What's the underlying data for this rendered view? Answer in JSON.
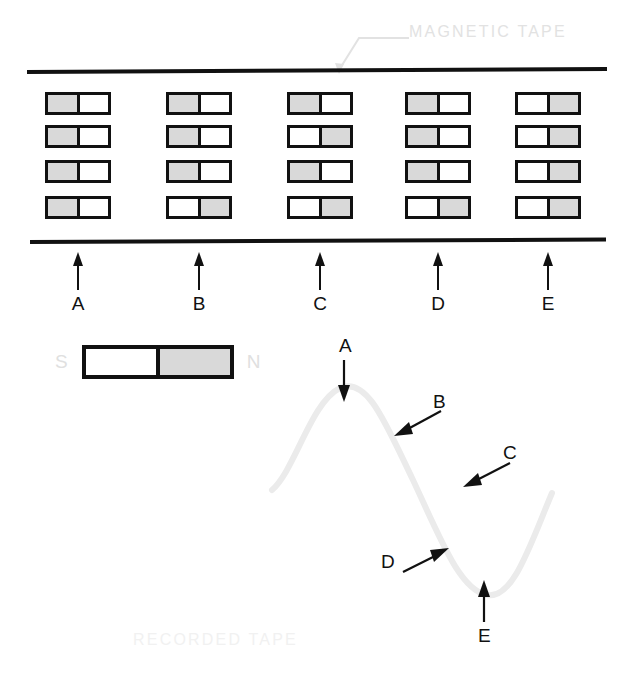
{
  "figure": {
    "top_caption": "MAGNETIC TAPE",
    "bottom_caption": "RECORDED TAPE"
  },
  "legend": {
    "south_label": "S",
    "north_label": "N",
    "gray_means": "N",
    "white_means": "S"
  },
  "colors": {
    "ink": "#111111",
    "magnet_gray": "#d9d9d9",
    "magnet_white": "#ffffff",
    "caption_gray": "#e2e2e2",
    "wave_gray": "#ebebeb"
  },
  "tape": {
    "columns": [
      {
        "id": "A",
        "label": "A",
        "x": 78,
        "magnets": [
          "gray-left",
          "gray-left",
          "gray-left",
          "gray-left"
        ]
      },
      {
        "id": "B",
        "label": "B",
        "x": 199,
        "magnets": [
          "gray-left",
          "gray-left",
          "gray-left",
          "gray-right"
        ]
      },
      {
        "id": "C",
        "label": "C",
        "x": 320,
        "magnets": [
          "gray-left",
          "gray-right",
          "gray-left",
          "gray-right"
        ]
      },
      {
        "id": "D",
        "label": "D",
        "x": 438,
        "magnets": [
          "gray-left",
          "gray-left",
          "gray-left",
          "gray-right"
        ]
      },
      {
        "id": "E",
        "label": "E",
        "x": 548,
        "magnets": [
          "gray-right",
          "gray-right",
          "gray-right",
          "gray-right"
        ]
      }
    ],
    "rows_y": [
      92,
      125,
      160,
      196
    ]
  },
  "chart_data": {
    "type": "line",
    "title": "RECORDED TAPE",
    "annotations": [
      {
        "label": "A",
        "position": "crest",
        "arrow": "down"
      },
      {
        "label": "B",
        "position": "falling-upper",
        "arrow": "down-left"
      },
      {
        "label": "C",
        "position": "falling-lower",
        "arrow": "down-left"
      },
      {
        "label": "D",
        "position": "rising-to-trough",
        "arrow": "up-right"
      },
      {
        "label": "E",
        "position": "trough",
        "arrow": "up"
      }
    ],
    "path": "M 17 160 C 40 140 56 72 85 58 C 112 46 130 92 158 150 C 186 210 205 260 232 265 C 258 270 275 215 297 163",
    "grid": false,
    "legend": "none"
  }
}
